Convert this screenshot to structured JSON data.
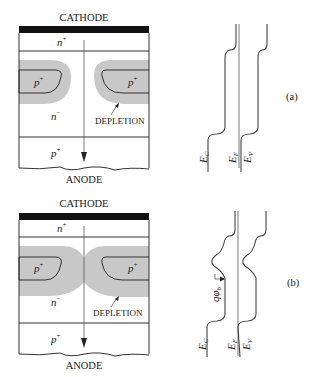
{
  "figure": {
    "panels": [
      {
        "id": "a",
        "label": "(a)",
        "device": {
          "top_label": "CATHODE",
          "bottom_label": "ANODE",
          "regions": {
            "top": {
              "name": "n",
              "sup": "+"
            },
            "island_left": {
              "name": "p",
              "sup": "+"
            },
            "island_right": {
              "name": "p",
              "sup": "+"
            },
            "drift": {
              "name": "n",
              "sup": "−"
            },
            "bottom": {
              "name": "p",
              "sup": "+"
            }
          },
          "depletion_label": "DEPLETION",
          "depletion_state": "separated"
        },
        "band_diagram": {
          "labels": {
            "ec": "E",
            "ec_sub": "C",
            "ef": "E",
            "ef_sub": "F",
            "ev": "E",
            "ev_sub": "V"
          }
        }
      },
      {
        "id": "b",
        "label": "(b)",
        "device": {
          "top_label": "CATHODE",
          "bottom_label": "ANODE",
          "regions": {
            "top": {
              "name": "n",
              "sup": "+"
            },
            "island_left": {
              "name": "p",
              "sup": "+"
            },
            "island_right": {
              "name": "p",
              "sup": "+"
            },
            "drift": {
              "name": "n",
              "sup": "−"
            },
            "bottom": {
              "name": "p",
              "sup": "+"
            }
          },
          "depletion_label": "DEPLETION",
          "depletion_state": "merged"
        },
        "band_diagram": {
          "labels": {
            "ec": "E",
            "ec_sub": "C",
            "ef": "E",
            "ef_sub": "F",
            "ev": "E",
            "ev_sub": "V"
          },
          "barrier_label": "qφ",
          "barrier_sub": "b"
        }
      }
    ],
    "colors": {
      "depletion": "#c8c8c8",
      "contact": "#111111",
      "lines": "#333333"
    }
  }
}
